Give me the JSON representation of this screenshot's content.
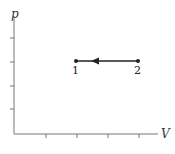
{
  "diagram": {
    "type": "pV-diagram",
    "axes": {
      "y_label": "p",
      "x_label": "V",
      "y_ticks": 4,
      "x_ticks": 4
    },
    "process": {
      "from": "2",
      "to": "1",
      "direction": "leftward (compression at constant pressure)"
    },
    "points": [
      {
        "label": "1"
      },
      {
        "label": "2"
      }
    ],
    "colors": {
      "axis": "#666666",
      "line": "#222222"
    }
  }
}
